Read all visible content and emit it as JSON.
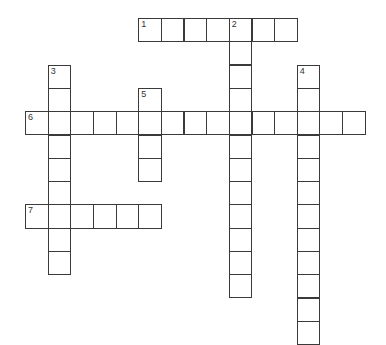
{
  "puzzle": {
    "type": "crossword",
    "entries": [
      {
        "number": "1",
        "direction": "across",
        "row": 0,
        "col": 5,
        "length": 7
      },
      {
        "number": "2",
        "direction": "down",
        "row": 0,
        "col": 9,
        "length": 12
      },
      {
        "number": "3",
        "direction": "down",
        "row": 2,
        "col": 1,
        "length": 9
      },
      {
        "number": "4",
        "direction": "down",
        "row": 2,
        "col": 12,
        "length": 12
      },
      {
        "number": "5",
        "direction": "down",
        "row": 3,
        "col": 5,
        "length": 4
      },
      {
        "number": "6",
        "direction": "across",
        "row": 4,
        "col": 0,
        "length": 15
      },
      {
        "number": "7",
        "direction": "across",
        "row": 8,
        "col": 0,
        "length": 6
      }
    ]
  }
}
